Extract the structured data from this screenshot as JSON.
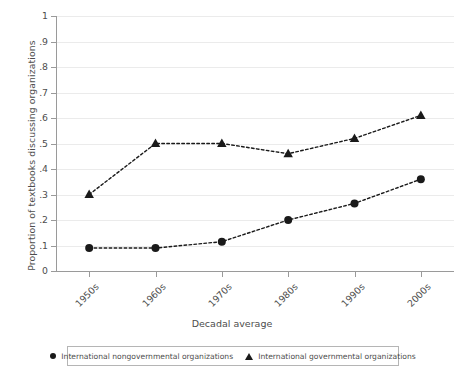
{
  "chart_data": {
    "type": "line",
    "title": "",
    "xlabel": "Decadal average",
    "ylabel": "Proportion of textbooks discussing organizations",
    "categories": [
      "1950s",
      "1960s",
      "1970s",
      "1980s",
      "1990s",
      "2000s"
    ],
    "ylim": [
      0,
      1
    ],
    "yticks": [
      0,
      0.1,
      0.2,
      0.3,
      0.4,
      0.5,
      0.6,
      0.7,
      0.8,
      0.9,
      1
    ],
    "ytick_labels": [
      "0",
      ".1",
      ".2",
      ".3",
      ".4",
      ".5",
      ".6",
      ".7",
      ".8",
      ".9",
      "1"
    ],
    "grid": "horizontal",
    "legend_position": "bottom",
    "line_style": "dashed",
    "series": [
      {
        "name": "International nongovernmental organizations",
        "marker": "circle",
        "color": "#1a1a1a",
        "values": [
          0.09,
          0.09,
          0.115,
          0.2,
          0.265,
          0.36
        ]
      },
      {
        "name": "International governmental organizations",
        "marker": "triangle",
        "color": "#1a1a1a",
        "values": [
          0.3,
          0.5,
          0.5,
          0.46,
          0.52,
          0.61
        ]
      }
    ]
  },
  "axis": {
    "y_title": "Proportion of textbooks discussing organizations",
    "x_title": "Decadal average"
  },
  "legend": {
    "entries": [
      {
        "label": "International nongovernmental organizations",
        "marker": "circle-marker"
      },
      {
        "label": "International governmental organizations",
        "marker": "triangle-marker"
      }
    ]
  },
  "colors": {
    "series": "#1a1a1a",
    "grid": "#ebebeb",
    "axis": "#9a9a9a",
    "text": "#4d4d4d",
    "legend_border": "#b5b5b5"
  }
}
